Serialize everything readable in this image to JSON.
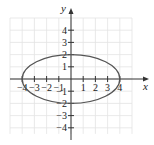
{
  "chart_data": {
    "type": "line",
    "title": "",
    "xlabel": "x",
    "ylabel": "y",
    "xlim": [
      -5,
      6
    ],
    "ylim": [
      -5,
      6
    ],
    "grid": true,
    "x_ticks": [
      -4,
      -3,
      -2,
      -1,
      1,
      2,
      3,
      4
    ],
    "y_ticks": [
      -4,
      -3,
      -2,
      -1,
      1,
      2,
      3,
      4
    ],
    "x_tick_labels": [
      "−4",
      "−3",
      "−2",
      "−1",
      "1",
      "2",
      "3",
      "4"
    ],
    "y_tick_labels": [
      "−4",
      "−3",
      "−2",
      "−1",
      "1",
      "2",
      "3",
      "4"
    ],
    "series": [
      {
        "name": "ellipse",
        "shape": "ellipse",
        "center": [
          0,
          0
        ],
        "semi_major_x": 4,
        "semi_minor_y": 2,
        "equation": "x^2/16 + y^2/4 = 1",
        "intercepts": [
          [
            -4,
            0
          ],
          [
            4,
            0
          ],
          [
            0,
            2
          ],
          [
            0,
            -2
          ]
        ]
      }
    ]
  },
  "colors": {
    "grid": "#e3e3e3",
    "axis": "#333333",
    "curve": "#555555"
  }
}
